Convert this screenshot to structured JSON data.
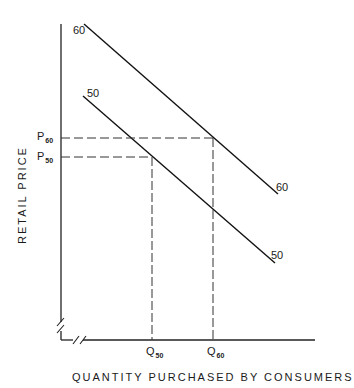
{
  "diagram": {
    "type": "supply-demand-shift",
    "x_axis_label": "QUANTITY PURCHASED BY CONSUMERS",
    "y_axis_label": "RETAIL PRICE",
    "curves": [
      {
        "id": "60",
        "start_label": "60",
        "end_label": "60"
      },
      {
        "id": "50",
        "start_label": "50",
        "end_label": "50"
      }
    ],
    "price_marks": [
      {
        "letter": "P",
        "sub": "60"
      },
      {
        "letter": "P",
        "sub": "50"
      }
    ],
    "quantity_marks": [
      {
        "letter": "Q",
        "sub": "50"
      },
      {
        "letter": "Q",
        "sub": "60"
      }
    ],
    "axis_breaks": true
  }
}
